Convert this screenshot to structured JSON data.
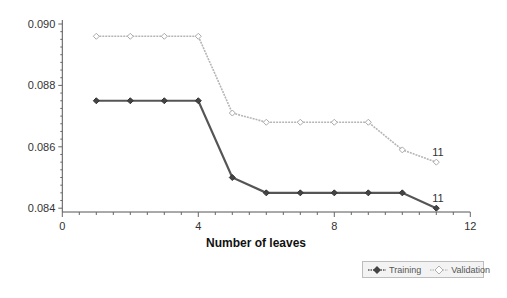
{
  "chart_data": {
    "type": "line",
    "title": "",
    "xlabel": "Number of leaves",
    "ylabel": "",
    "xlim": [
      0,
      12
    ],
    "ylim": [
      0.084,
      0.09
    ],
    "x_ticks": [
      "0",
      "4",
      "8",
      "12"
    ],
    "y_ticks": [
      "0.084",
      "0.086",
      "0.088",
      "0.090"
    ],
    "grid": false,
    "legend_position": "bottom-right",
    "x": [
      1,
      2,
      3,
      4,
      5,
      6,
      7,
      8,
      9,
      10,
      11
    ],
    "series": [
      {
        "name": "Training",
        "color": "#555555",
        "marker": "diamond",
        "values": [
          0.0875,
          0.0875,
          0.0875,
          0.0875,
          0.085,
          0.0845,
          0.0845,
          0.0845,
          0.0845,
          0.0845,
          0.084
        ],
        "end_label": "11"
      },
      {
        "name": "Validation",
        "color": "#b5b5b5",
        "marker": "diamond",
        "values": [
          0.0896,
          0.0896,
          0.0896,
          0.0896,
          0.0871,
          0.0868,
          0.0868,
          0.0868,
          0.0868,
          0.0859,
          0.0855
        ],
        "end_label": "11"
      }
    ]
  },
  "legend": {
    "items": [
      {
        "label": "Training"
      },
      {
        "label": "Validation"
      }
    ]
  }
}
